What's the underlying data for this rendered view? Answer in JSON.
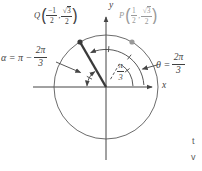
{
  "figure": {
    "axes": {
      "x": "x",
      "y": "y"
    },
    "point_q": {
      "name": "Q",
      "open": "(",
      "x_num": "−1",
      "x_den": "2",
      "comma": ",",
      "y_rad": "√",
      "y_arg": "3",
      "y_den": "2",
      "close": ")"
    },
    "point_p": {
      "name": "P",
      "open": "(",
      "x_num": "1",
      "x_den": "2",
      "comma": ",",
      "y_rad": "√",
      "y_arg": "3",
      "y_den": "2",
      "close": ")"
    },
    "alpha": {
      "lhs": "α = π −",
      "num": "2π",
      "den": "3"
    },
    "theta": {
      "lhs": "θ =",
      "num": "2π",
      "den": "3"
    },
    "inner_angle": {
      "num": "π",
      "den": "3"
    },
    "edge_fragments": {
      "line1": "t",
      "line2": "v"
    },
    "colors": {
      "ink": "#454545",
      "muted": "#999999"
    }
  }
}
